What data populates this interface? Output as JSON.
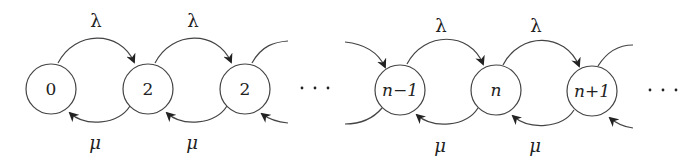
{
  "diagram": {
    "type": "birth-death-chain",
    "arrival_rate_label": "λ",
    "service_rate_label": "μ",
    "nodes": [
      {
        "id": "s0",
        "label": "0",
        "cx": 51,
        "cy": 89
      },
      {
        "id": "s1",
        "label": "2",
        "cx": 148,
        "cy": 89
      },
      {
        "id": "s2",
        "label": "2",
        "cx": 245,
        "cy": 89
      },
      {
        "id": "sn-1",
        "label": "n−1",
        "cx": 400,
        "cy": 90
      },
      {
        "id": "sn",
        "label": "n",
        "cx": 496,
        "cy": 90
      },
      {
        "id": "sn+1",
        "label": "n+1",
        "cx": 592,
        "cy": 91
      }
    ],
    "ellipses": [
      {
        "label": "· · ·",
        "x": 310,
        "y": 88
      },
      {
        "label": "· · ·",
        "x": 660,
        "y": 90
      }
    ],
    "forward_edges": [
      {
        "from": "0",
        "to": "2",
        "label": "λ"
      },
      {
        "from": "2",
        "to": "2",
        "label": "λ"
      },
      {
        "from": "n−1",
        "to": "n",
        "label": "λ"
      },
      {
        "from": "n",
        "to": "n+1",
        "label": "λ"
      }
    ],
    "backward_edges": [
      {
        "from": "2",
        "to": "0",
        "label": "μ"
      },
      {
        "from": "2",
        "to": "2",
        "label": "μ"
      },
      {
        "from": "n",
        "to": "n−1",
        "label": "μ"
      },
      {
        "from": "n+1",
        "to": "n",
        "label": "μ"
      }
    ]
  }
}
